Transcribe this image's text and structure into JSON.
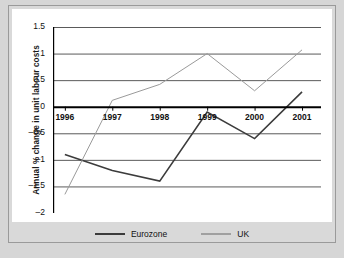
{
  "chart_data": {
    "type": "line",
    "title": "",
    "xlabel": "",
    "ylabel": "Annual % change in unit labour costs",
    "categories": [
      "1996",
      "1997",
      "1998",
      "1999",
      "2000",
      "2001"
    ],
    "x": [
      1996,
      1997,
      1998,
      1999,
      2000,
      2001
    ],
    "xlim": [
      1995.75,
      2001.4
    ],
    "ylim": [
      -2,
      1.5
    ],
    "yticks": [
      1.5,
      1,
      0.5,
      0,
      -0.5,
      -1,
      -1.5,
      -2
    ],
    "ytick_labels": [
      "1.5",
      "1",
      "0.5",
      "0",
      "-0.5",
      "-1",
      "-1.5",
      "-2"
    ],
    "grid": true,
    "grid_axis": "y",
    "zero_line": true,
    "legend_position": "bottom",
    "series": [
      {
        "name": "Eurozone",
        "color": "#3c3c3c",
        "width": 1.6,
        "values": [
          -0.9,
          -1.2,
          -1.4,
          -0.1,
          -0.6,
          0.28
        ]
      },
      {
        "name": "UK",
        "color": "#9a9a9a",
        "width": 1.0,
        "values": [
          -1.65,
          0.12,
          0.42,
          1.0,
          0.3,
          1.07
        ]
      }
    ]
  },
  "legend": {
    "items": [
      {
        "label": "Eurozone",
        "color": "#3c3c3c",
        "width": "2.2px"
      },
      {
        "label": "UK",
        "color": "#a0a0a0",
        "width": "1.2px"
      }
    ]
  },
  "colors": {
    "page_background": "#d6d6d6",
    "panel_background": "#ffffff",
    "frame_border": "#9a9a9a",
    "grid": "#5a5a5a",
    "axis": "#000000",
    "text": "#111111"
  }
}
